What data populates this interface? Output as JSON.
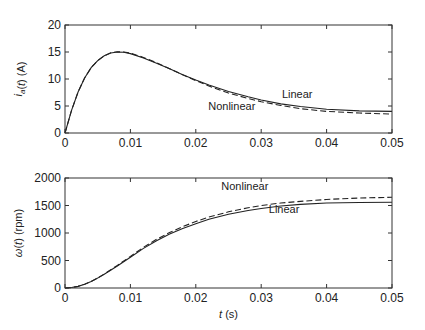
{
  "chart_data": [
    {
      "type": "line",
      "title": "",
      "xlabel": "",
      "ylabel": "i_a(t) (A)",
      "ylabel_parts": {
        "main": "i",
        "sub": "a",
        "rest": "(t) (A)"
      },
      "xlim": [
        0,
        0.05
      ],
      "ylim": [
        0,
        20
      ],
      "xticks": [
        0,
        0.01,
        0.02,
        0.03,
        0.04,
        0.05
      ],
      "xtick_labels": [
        "0",
        "0.01",
        "0.02",
        "0.03",
        "0.04",
        "0.05"
      ],
      "yticks": [
        0,
        5,
        10,
        15,
        20
      ],
      "ytick_labels": [
        "0",
        "5",
        "10",
        "15",
        "20"
      ],
      "grid": false,
      "legend": "inline annotations",
      "x": [
        0,
        0.001,
        0.002,
        0.003,
        0.004,
        0.005,
        0.006,
        0.007,
        0.008,
        0.009,
        0.01,
        0.012,
        0.014,
        0.016,
        0.018,
        0.02,
        0.022,
        0.025,
        0.028,
        0.03,
        0.033,
        0.036,
        0.04,
        0.045,
        0.05
      ],
      "series": [
        {
          "name": "Linear",
          "style": "solid",
          "values": [
            0,
            4.2,
            7.6,
            10.2,
            12.1,
            13.4,
            14.3,
            14.8,
            15.0,
            14.95,
            14.7,
            13.9,
            12.9,
            11.9,
            10.8,
            9.8,
            8.9,
            7.7,
            6.7,
            6.1,
            5.4,
            4.9,
            4.4,
            4.1,
            4.0
          ]
        },
        {
          "name": "Nonlinear",
          "style": "dashed",
          "values": [
            0,
            4.2,
            7.6,
            10.2,
            12.1,
            13.4,
            14.3,
            14.85,
            15.05,
            15.0,
            14.8,
            14.0,
            13.0,
            11.9,
            10.8,
            9.7,
            8.7,
            7.4,
            6.4,
            5.8,
            5.1,
            4.5,
            4.0,
            3.7,
            3.5
          ]
        }
      ],
      "annotations": [
        {
          "text": "Linear",
          "x": 0.0355,
          "y": 6.5
        },
        {
          "text": "Nonlinear",
          "x": 0.0255,
          "y": 4.2
        }
      ]
    },
    {
      "type": "line",
      "title": "",
      "xlabel": "t (s)",
      "xlabel_parts": {
        "var": "t",
        "rest": " (s)"
      },
      "ylabel": "ω(t) (rpm)",
      "ylabel_parts": {
        "main": "ω",
        "rest": "(t) (rpm)"
      },
      "xlim": [
        0,
        0.05
      ],
      "ylim": [
        0,
        2000
      ],
      "xticks": [
        0,
        0.01,
        0.02,
        0.03,
        0.04,
        0.05
      ],
      "xtick_labels": [
        "0",
        "0.01",
        "0.02",
        "0.03",
        "0.04",
        "0.05"
      ],
      "yticks": [
        0,
        500,
        1000,
        1500,
        2000
      ],
      "ytick_labels": [
        "0",
        "500",
        "1000",
        "1500",
        "2000"
      ],
      "grid": false,
      "legend": "inline annotations",
      "x": [
        0,
        0.001,
        0.002,
        0.003,
        0.004,
        0.005,
        0.006,
        0.008,
        0.01,
        0.012,
        0.014,
        0.016,
        0.018,
        0.02,
        0.022,
        0.025,
        0.028,
        0.03,
        0.033,
        0.036,
        0.04,
        0.045,
        0.05
      ],
      "series": [
        {
          "name": "Linear",
          "style": "solid",
          "values": [
            0,
            8,
            30,
            70,
            120,
            180,
            250,
            400,
            560,
            720,
            860,
            980,
            1080,
            1170,
            1250,
            1340,
            1410,
            1445,
            1490,
            1520,
            1545,
            1555,
            1560
          ]
        },
        {
          "name": "Nonlinear",
          "style": "dashed",
          "values": [
            0,
            8,
            30,
            70,
            120,
            182,
            255,
            410,
            575,
            740,
            885,
            1010,
            1115,
            1210,
            1290,
            1385,
            1460,
            1500,
            1545,
            1575,
            1610,
            1635,
            1650
          ]
        }
      ],
      "annotations": [
        {
          "text": "Nonlinear",
          "x": 0.0275,
          "y": 1790
        },
        {
          "text": "Linear",
          "x": 0.0335,
          "y": 1360
        }
      ]
    }
  ]
}
